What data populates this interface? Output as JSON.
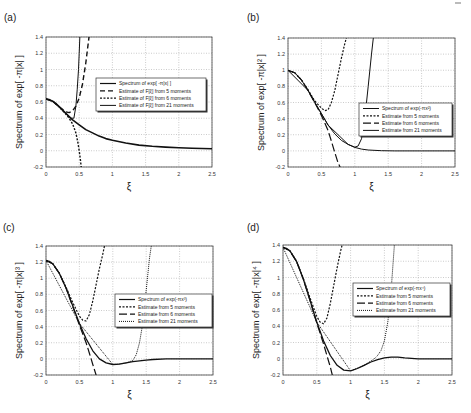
{
  "figure": {
    "panels": [
      {
        "id": "a",
        "label": "(a)"
      },
      {
        "id": "b",
        "label": "(b)"
      },
      {
        "id": "c",
        "label": "(c)"
      },
      {
        "id": "d",
        "label": "(d)"
      }
    ]
  },
  "chart_data": [
    {
      "panel": "(a)",
      "type": "line",
      "title": "",
      "xlabel": "ξ",
      "ylabel": "Spectrum of exp[ -π|x| ]",
      "xlim": [
        0,
        2.5
      ],
      "ylim": [
        -0.2,
        1.4
      ],
      "xticks": [
        "0",
        "0.5",
        "1",
        "1.5",
        "2",
        "2.5"
      ],
      "yticks": [
        "-0.2",
        "0",
        "0.2",
        "0.4",
        "0.6",
        "0.8",
        "1",
        "1.2",
        "1.4"
      ],
      "grid": true,
      "legend_position": "center-right",
      "box": {
        "left": 46,
        "top": 37,
        "right": 212,
        "bottom": 167
      },
      "legend_box": {
        "x": 96,
        "y": 78,
        "w": 110,
        "h": 33
      },
      "series": [
        {
          "name": "Spectrum of exp[ -π|x| ]",
          "style": "solid",
          "width": 1.6,
          "x": [
            0,
            0.05,
            0.1,
            0.15,
            0.2,
            0.25,
            0.3,
            0.35,
            0.4,
            0.5,
            0.6,
            0.7,
            0.8,
            0.9,
            1.0,
            1.2,
            1.4,
            1.6,
            1.8,
            2.0,
            2.2,
            2.5
          ],
          "y": [
            0.637,
            0.63,
            0.61,
            0.58,
            0.54,
            0.5,
            0.46,
            0.42,
            0.38,
            0.32,
            0.26,
            0.22,
            0.18,
            0.15,
            0.13,
            0.095,
            0.07,
            0.055,
            0.045,
            0.036,
            0.03,
            0.024
          ]
        },
        {
          "name": "Estimate of F[ξ] from 5 moments",
          "style": "dashed",
          "width": 1.4,
          "x": [
            0,
            0.1,
            0.2,
            0.3,
            0.35,
            0.4,
            0.45,
            0.5,
            0.55,
            0.6,
            0.65
          ],
          "y": [
            0.637,
            0.61,
            0.54,
            0.48,
            0.47,
            0.49,
            0.55,
            0.65,
            0.82,
            1.08,
            1.42
          ]
        },
        {
          "name": "Estimate of F[ξ] from 6 moments",
          "style": "dotted",
          "width": 1.4,
          "x": [
            0,
            0.1,
            0.2,
            0.3,
            0.35,
            0.4,
            0.45,
            0.48,
            0.5,
            0.52,
            0.53
          ],
          "y": [
            0.637,
            0.61,
            0.54,
            0.45,
            0.4,
            0.33,
            0.22,
            0.1,
            0.0,
            -0.12,
            -0.2
          ]
        },
        {
          "name": "Estimate of F[ξ] from 21 moments",
          "style": "solid",
          "width": 1.0,
          "x": [
            0,
            0.1,
            0.2,
            0.3,
            0.38,
            0.42,
            0.45,
            0.47,
            0.49,
            0.5,
            0.51
          ],
          "y": [
            0.637,
            0.61,
            0.54,
            0.46,
            0.4,
            0.4,
            0.55,
            0.75,
            1.0,
            1.2,
            1.42
          ]
        }
      ]
    },
    {
      "panel": "(b)",
      "type": "line",
      "title": "",
      "xlabel": "ξ",
      "ylabel": "Spectrum of exp[ -π|x|² ]",
      "xlim": [
        0,
        2.5
      ],
      "ylim": [
        -0.2,
        1.4
      ],
      "xticks": [
        "0",
        "0.5",
        "1",
        "1.5",
        "2",
        "2.5"
      ],
      "yticks": [
        "-0.2",
        "0",
        "0.2",
        "0.4",
        "0.6",
        "0.8",
        "1",
        "1.2",
        "1.4"
      ],
      "grid": true,
      "legend_position": "center-right",
      "box": {
        "left": 288,
        "top": 38,
        "right": 455,
        "bottom": 167
      },
      "legend_box": {
        "x": 359,
        "y": 103,
        "w": 93,
        "h": 33
      },
      "series": [
        {
          "name": "Spectrum of exp(-πx²)",
          "style": "solid",
          "width": 1.0,
          "x": [
            0,
            0.1,
            0.2,
            0.3,
            0.4,
            0.5,
            0.6,
            0.7,
            0.8,
            0.9,
            1.0,
            1.1,
            1.2,
            1.4,
            1.6,
            2.0,
            2.5
          ],
          "y": [
            1.0,
            0.97,
            0.88,
            0.75,
            0.6,
            0.46,
            0.32,
            0.21,
            0.13,
            0.08,
            0.043,
            0.022,
            0.011,
            0.002,
            0.0,
            0.0,
            0.0
          ]
        },
        {
          "name": "Estimate from 5 moments",
          "style": "dotted",
          "width": 1.2,
          "x": [
            0,
            0.1,
            0.2,
            0.3,
            0.4,
            0.5,
            0.55,
            0.6,
            0.65,
            0.7,
            0.75,
            0.8,
            0.85,
            0.88
          ],
          "y": [
            1.0,
            0.97,
            0.88,
            0.76,
            0.62,
            0.53,
            0.5,
            0.51,
            0.6,
            0.75,
            0.95,
            1.15,
            1.33,
            1.42
          ]
        },
        {
          "name": "Estimate from 6 moments",
          "style": "longdash",
          "width": 1.2,
          "x": [
            0,
            0.1,
            0.2,
            0.3,
            0.4,
            0.5,
            0.55,
            0.6,
            0.65,
            0.7,
            0.75,
            0.78
          ],
          "y": [
            1.0,
            0.97,
            0.88,
            0.75,
            0.6,
            0.44,
            0.35,
            0.25,
            0.12,
            -0.02,
            -0.15,
            -0.2
          ]
        },
        {
          "name": "Estimate from 21 moments",
          "style": "solid",
          "width": 1.0,
          "x": [
            0,
            0.3,
            0.6,
            0.9,
            1.0,
            1.05,
            1.1,
            1.15,
            1.2,
            1.25,
            1.28
          ],
          "y": [
            1.0,
            0.75,
            0.32,
            0.08,
            0.045,
            0.06,
            0.15,
            0.4,
            0.8,
            1.2,
            1.42
          ]
        }
      ]
    },
    {
      "panel": "(c)",
      "type": "line",
      "title": "",
      "xlabel": "ξ",
      "ylabel": "Spectrum of exp[ -π|x|³ ]",
      "xlim": [
        0,
        2.5
      ],
      "ylim": [
        -0.2,
        1.4
      ],
      "xticks": [
        "0",
        "0.5",
        "1",
        "1.5",
        "2",
        "2.5"
      ],
      "yticks": [
        "-0.2",
        "0",
        "0.2",
        "0.4",
        "0.6",
        "0.8",
        "1",
        "1.2",
        "1.4"
      ],
      "grid": true,
      "legend_position": "center-right",
      "box": {
        "left": 46,
        "top": 246,
        "right": 213,
        "bottom": 375
      },
      "legend_box": {
        "x": 115,
        "y": 294,
        "w": 97,
        "h": 33
      },
      "series": [
        {
          "name": "Spectrum of exp(-πx³)",
          "style": "solid",
          "width": 1.3,
          "x": [
            0,
            0.05,
            0.1,
            0.2,
            0.3,
            0.4,
            0.5,
            0.6,
            0.7,
            0.8,
            0.9,
            1.0,
            1.1,
            1.2,
            1.3,
            1.4,
            1.5,
            1.6,
            1.8,
            2.0,
            2.5
          ],
          "y": [
            1.22,
            1.21,
            1.18,
            1.06,
            0.88,
            0.66,
            0.44,
            0.25,
            0.1,
            0.0,
            -0.05,
            -0.07,
            -0.065,
            -0.05,
            -0.035,
            -0.025,
            -0.015,
            -0.008,
            0.0,
            0.0,
            0.0
          ]
        },
        {
          "name": "Estimate from 5 moments",
          "style": "dotted",
          "width": 1.2,
          "x": [
            0,
            0.1,
            0.2,
            0.3,
            0.4,
            0.5,
            0.55,
            0.6,
            0.65,
            0.7,
            0.75,
            0.8,
            0.85,
            0.88
          ],
          "y": [
            1.22,
            1.18,
            1.06,
            0.89,
            0.7,
            0.53,
            0.48,
            0.47,
            0.55,
            0.72,
            0.92,
            1.12,
            1.3,
            1.42
          ]
        },
        {
          "name": "Estimate from 6 moments",
          "style": "longdash",
          "width": 1.2,
          "x": [
            0,
            0.1,
            0.2,
            0.3,
            0.4,
            0.5,
            0.6,
            0.65,
            0.7,
            0.75
          ],
          "y": [
            1.22,
            1.18,
            1.06,
            0.88,
            0.65,
            0.42,
            0.2,
            0.07,
            -0.07,
            -0.2
          ]
        },
        {
          "name": "Estimate from 21 moments",
          "style": "dotted-fine",
          "width": 1.0,
          "x": [
            0,
            0.5,
            1.0,
            1.2,
            1.3,
            1.35,
            1.4,
            1.45,
            1.5,
            1.55,
            1.58
          ],
          "y": [
            1.22,
            0.44,
            -0.07,
            -0.05,
            -0.02,
            0.05,
            0.2,
            0.45,
            0.85,
            1.25,
            1.42
          ]
        }
      ]
    },
    {
      "panel": "(d)",
      "type": "line",
      "title": "",
      "xlabel": "ξ",
      "ylabel": "Spectrum of exp[ -π|x|⁴ ]",
      "xlim": [
        0,
        2.5
      ],
      "ylim": [
        -0.2,
        1.4
      ],
      "xticks": [
        "0",
        "0.5",
        "1",
        "1.5",
        "2",
        "2.5"
      ],
      "yticks": [
        "-0.2",
        "0",
        "0.2",
        "0.4",
        "0.6",
        "0.8",
        "1",
        "1.2",
        "1.4"
      ],
      "grid": true,
      "legend_position": "center-right",
      "box": {
        "left": 283,
        "top": 245,
        "right": 452,
        "bottom": 375
      },
      "legend_box": {
        "x": 353,
        "y": 283,
        "w": 97,
        "h": 33
      },
      "series": [
        {
          "name": "Spectrum of exp(-πx⁴)",
          "style": "solid",
          "width": 1.3,
          "x": [
            0,
            0.05,
            0.1,
            0.2,
            0.3,
            0.4,
            0.5,
            0.6,
            0.7,
            0.8,
            0.9,
            1.0,
            1.1,
            1.2,
            1.3,
            1.4,
            1.5,
            1.6,
            1.7,
            1.8,
            2.0,
            2.5
          ],
          "y": [
            1.37,
            1.36,
            1.33,
            1.2,
            0.98,
            0.72,
            0.45,
            0.22,
            0.04,
            -0.08,
            -0.14,
            -0.15,
            -0.12,
            -0.08,
            -0.04,
            -0.01,
            0.01,
            0.02,
            0.02,
            0.012,
            0.0,
            0.0
          ]
        },
        {
          "name": "Estimate from 5 moments",
          "style": "dotted",
          "width": 1.2,
          "x": [
            0,
            0.1,
            0.2,
            0.3,
            0.4,
            0.5,
            0.55,
            0.6,
            0.65,
            0.7,
            0.75,
            0.8,
            0.85,
            0.88
          ],
          "y": [
            1.37,
            1.33,
            1.2,
            0.99,
            0.75,
            0.52,
            0.45,
            0.43,
            0.5,
            0.68,
            0.9,
            1.12,
            1.32,
            1.42
          ]
        },
        {
          "name": "Estimate from 6 moments",
          "style": "longdash",
          "width": 1.2,
          "x": [
            0,
            0.1,
            0.2,
            0.3,
            0.4,
            0.5,
            0.6,
            0.65,
            0.7,
            0.73
          ],
          "y": [
            1.37,
            1.33,
            1.2,
            0.98,
            0.72,
            0.44,
            0.18,
            0.04,
            -0.1,
            -0.2
          ]
        },
        {
          "name": "Estimate from 21 moments",
          "style": "dotted-fine",
          "width": 1.0,
          "x": [
            0,
            0.5,
            1.0,
            1.2,
            1.35,
            1.4,
            1.45,
            1.5,
            1.55,
            1.6,
            1.63,
            1.65
          ],
          "y": [
            1.37,
            0.45,
            -0.15,
            -0.08,
            0.0,
            0.04,
            0.1,
            0.22,
            0.45,
            0.85,
            1.2,
            1.42
          ]
        }
      ]
    }
  ]
}
